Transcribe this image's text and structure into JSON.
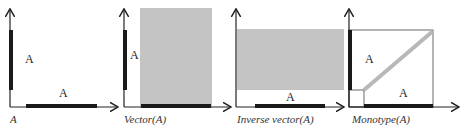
{
  "colors": {
    "axis": "#222222",
    "bar": "#1a1a1a",
    "fill": "#c4c4c4",
    "diag": "#b8b8b8"
  },
  "panels": [
    {
      "caption": "A",
      "label_v": "A",
      "label_h": "A"
    },
    {
      "caption": "Vector(A)",
      "label_v": "A"
    },
    {
      "caption": "Inverse vector(A)",
      "label_h": "A"
    },
    {
      "caption": "Monotype(A)",
      "label_v": "A",
      "label_h": "A"
    }
  ]
}
